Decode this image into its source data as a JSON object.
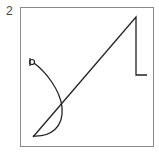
{
  "figure": {
    "label": "2",
    "frame_color": "#8a8a8a",
    "stroke_color": "#222222"
  }
}
